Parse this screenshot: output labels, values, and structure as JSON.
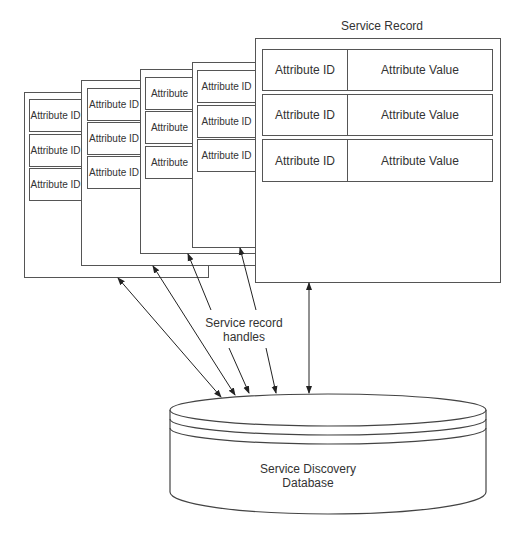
{
  "diagram": {
    "title": "Service Record",
    "stacked_records": [
      {
        "rows": [
          "Attribute ID",
          "Attribute ID",
          "Attribute ID"
        ]
      },
      {
        "rows": [
          "Attribute ID",
          "Attribute ID",
          "Attribute ID"
        ]
      },
      {
        "rows": [
          "Attribute",
          "Attribute",
          "Attribute"
        ]
      },
      {
        "rows": [
          "Attribute ID",
          "Attribute ID",
          "Attribute ID"
        ]
      }
    ],
    "main_record": {
      "rows": [
        {
          "id": "Attribute ID",
          "value": "Attribute Value"
        },
        {
          "id": "Attribute ID",
          "value": "Attribute Value"
        },
        {
          "id": "Attribute ID",
          "value": "Attribute Value"
        }
      ]
    },
    "handles_label_line1": "Service record",
    "handles_label_line2": "handles",
    "database_label_line1": "Service Discovery",
    "database_label_line2": "Database",
    "colors": {
      "stroke": "#555555",
      "text": "#333333",
      "background": "#ffffff"
    }
  }
}
